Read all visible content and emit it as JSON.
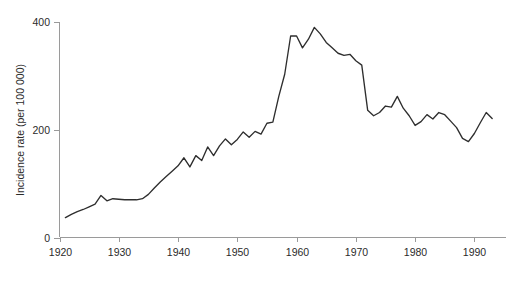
{
  "chart_data": {
    "type": "line",
    "title": "",
    "subtitle": "",
    "xlabel": "",
    "ylabel": "Incidence rate (per 100 000)",
    "xlim": [
      1920,
      1995
    ],
    "ylim": [
      0,
      400
    ],
    "grid": false,
    "legend": null,
    "x_ticks": [
      1920,
      1930,
      1940,
      1950,
      1960,
      1970,
      1980,
      1990
    ],
    "x_tick_labels": [
      "1920",
      "1930",
      "1940",
      "1950",
      "1960",
      "1970",
      "1980",
      "1990"
    ],
    "y_ticks": [
      0,
      200,
      400
    ],
    "y_tick_labels": [
      "0",
      "200",
      "400"
    ],
    "line_color": "#2e2e2e",
    "axis_color": "#9a9a9a",
    "background_color": "#ffffff",
    "series": [
      {
        "name": "Incidence rate",
        "x": [
          1921,
          1922,
          1923,
          1924,
          1925,
          1926,
          1927,
          1928,
          1929,
          1930,
          1931,
          1932,
          1933,
          1934,
          1935,
          1936,
          1937,
          1938,
          1939,
          1940,
          1941,
          1942,
          1943,
          1944,
          1945,
          1946,
          1947,
          1948,
          1949,
          1950,
          1951,
          1952,
          1953,
          1954,
          1955,
          1956,
          1957,
          1958,
          1959,
          1960,
          1961,
          1962,
          1963,
          1964,
          1965,
          1966,
          1967,
          1968,
          1969,
          1970,
          1971,
          1972,
          1973,
          1974,
          1975,
          1976,
          1977,
          1978,
          1979,
          1980,
          1981,
          1982,
          1983,
          1984,
          1985,
          1986,
          1987,
          1988,
          1989,
          1990,
          1991,
          1992,
          1993
        ],
        "values": [
          37,
          43,
          48,
          52,
          57,
          62,
          78,
          68,
          72,
          71,
          70,
          70,
          70,
          72,
          80,
          92,
          103,
          113,
          123,
          133,
          148,
          131,
          152,
          143,
          168,
          152,
          170,
          183,
          172,
          182,
          196,
          186,
          197,
          192,
          212,
          214,
          262,
          303,
          374,
          374,
          352,
          368,
          390,
          378,
          362,
          352,
          342,
          338,
          340,
          328,
          320,
          236,
          226,
          232,
          244,
          242,
          262,
          240,
          226,
          208,
          215,
          228,
          220,
          232,
          228,
          216,
          204,
          184,
          178,
          193,
          213,
          232,
          221
        ]
      }
    ]
  }
}
